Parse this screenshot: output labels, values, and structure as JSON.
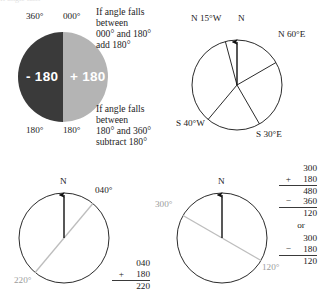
{
  "figure": {
    "background": "#ffffff",
    "ink": "#1a1a1a",
    "gray_line": "#b9b9b9"
  },
  "pie": {
    "name": "half-circle-plus-minus-180",
    "left_half_color": "#3a3a3a",
    "right_half_color": "#b4b4b4",
    "left_label": "- 180",
    "right_label": "+ 180",
    "top_left_tick": "360°",
    "top_right_tick": "000°",
    "bottom_left_tick": "180°",
    "bottom_right_tick": "180°"
  },
  "notes": {
    "top": {
      "line1": "If angle falls",
      "line2": "between",
      "line3": "000° and 180°",
      "line4": "add 180°"
    },
    "bottom": {
      "line1": "If angle falls",
      "line2": "between",
      "line3": "180° and 360°",
      "line4": "subtract 180°"
    }
  },
  "quadrant_circle": {
    "name": "quadrant-bearing-circle",
    "north_label": "N",
    "bearings": [
      {
        "label": "N 15°W",
        "angle_deg": 345
      },
      {
        "label": "N 60°E",
        "angle_deg": 60
      },
      {
        "label": "S 30°E",
        "angle_deg": 150
      },
      {
        "label": "S 40°W",
        "angle_deg": 220
      }
    ]
  },
  "example_left": {
    "name": "example-040-to-220",
    "north_label": "N",
    "forward_bearing": "040°",
    "back_bearing": "220°",
    "math": {
      "operand1": "040",
      "operator1": "+",
      "operand2": "180",
      "result": "220"
    }
  },
  "example_right": {
    "name": "example-300-to-120",
    "north_label": "N",
    "forward_bearing": "300°",
    "back_bearing": "120°",
    "math": {
      "a_operand1": "300",
      "a_operator1": "+",
      "a_operand2": "180",
      "a_subtotal": "480",
      "a_operator2": "−",
      "a_operand3": "360",
      "a_result": "120",
      "connector": "or",
      "b_operand1": "300",
      "b_operator1": "−",
      "b_operand2": "180",
      "b_result": "120"
    }
  },
  "faint_top_text": "If angle falls"
}
